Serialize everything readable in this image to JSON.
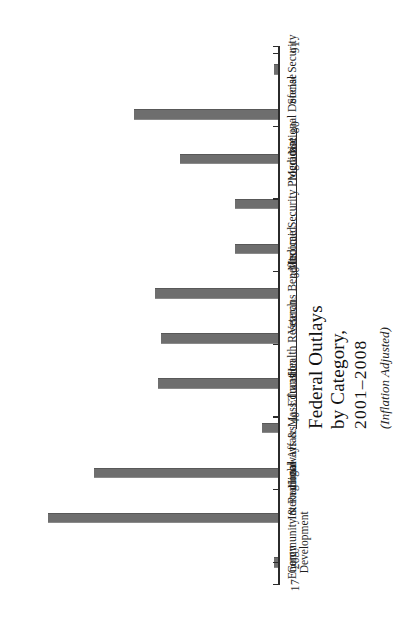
{
  "chart_data": {
    "type": "bar",
    "title": "Federal Outlays by Category, 2001–2008",
    "title_line1": "Federal Outlays",
    "title_line2": "by Category,",
    "title_years": "2001–2008",
    "subtitle": "(Inflation Adjusted)",
    "orientation": "vertical-bars-printed-sideways",
    "xlabel": "",
    "ylabel": "",
    "ylim": [
      17,
      91
    ],
    "grid": false,
    "legend": "none",
    "tick_labels": [
      "17",
      "20",
      "40",
      "60",
      "80",
      "91"
    ],
    "tick_values": [
      17,
      20,
      40,
      60,
      80,
      91
    ],
    "minor_tick_values": [
      30,
      50,
      70,
      90
    ],
    "axis_color": "#2b2b2b",
    "bar_color": "#6e6e6e",
    "background_color": "#ffffff",
    "categories": [
      "Energy",
      "Community & Regional Development",
      "International Affairs",
      "Highways & Mass Transit",
      "Education",
      "Health Research",
      "Veterans Benefits",
      "Medicaid",
      "Income Security Programs",
      "Medicare",
      "National Defense",
      "Social Security"
    ],
    "category_lines": [
      [
        "Energy"
      ],
      [
        "Community & Regional",
        "Development"
      ],
      [
        "International Affairs"
      ],
      [
        "Highways & Mass Transit"
      ],
      [
        "Education"
      ],
      [
        "Health Research"
      ],
      [
        "Veterans Benefits"
      ],
      [
        "Medicaid"
      ],
      [
        "Income Security Programs"
      ],
      [
        "Medicare"
      ],
      [
        "National Defense"
      ],
      [
        "Social Security"
      ]
    ],
    "values": [
      17,
      91,
      76,
      21,
      55,
      54,
      56,
      30,
      30,
      48,
      63,
      16
    ]
  }
}
